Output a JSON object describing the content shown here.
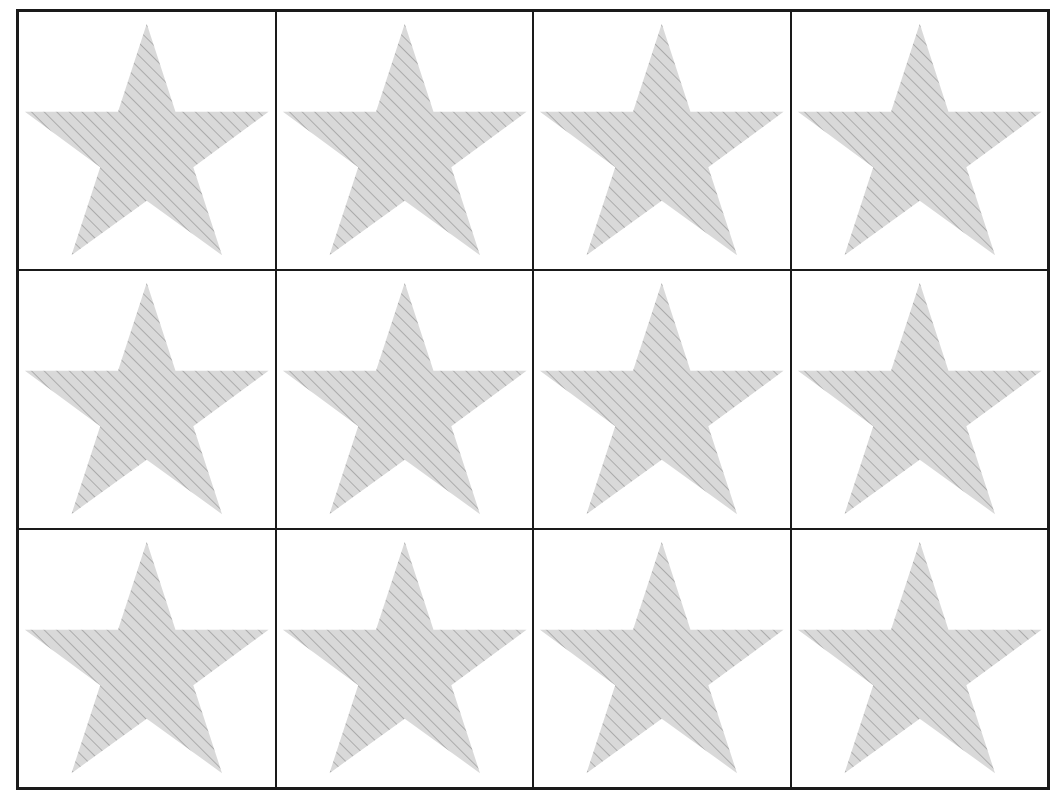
{
  "diagram": {
    "rows": 3,
    "columns": 4,
    "shape": "star-icon",
    "fill_color": "#d9d9d9",
    "hatch_color": "#8c8c8c",
    "border_color": "#1a1a1a",
    "cells": [
      {
        "row": 1,
        "col": 1,
        "shape": "star"
      },
      {
        "row": 1,
        "col": 2,
        "shape": "star"
      },
      {
        "row": 1,
        "col": 3,
        "shape": "star"
      },
      {
        "row": 1,
        "col": 4,
        "shape": "star"
      },
      {
        "row": 2,
        "col": 1,
        "shape": "star"
      },
      {
        "row": 2,
        "col": 2,
        "shape": "star"
      },
      {
        "row": 2,
        "col": 3,
        "shape": "star"
      },
      {
        "row": 2,
        "col": 4,
        "shape": "star"
      },
      {
        "row": 3,
        "col": 1,
        "shape": "star"
      },
      {
        "row": 3,
        "col": 2,
        "shape": "star"
      },
      {
        "row": 3,
        "col": 3,
        "shape": "star"
      },
      {
        "row": 3,
        "col": 4,
        "shape": "star"
      }
    ]
  }
}
